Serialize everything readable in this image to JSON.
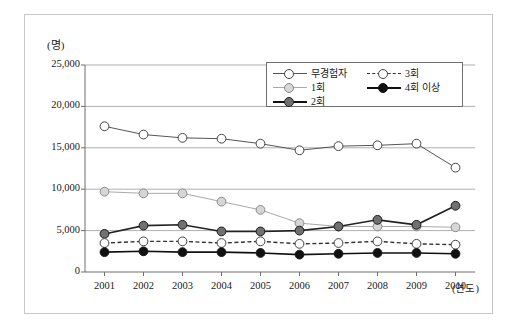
{
  "chart_data": {
    "type": "line",
    "title": "",
    "subtitle": "",
    "unit_label": "(명)",
    "xlabel": "(연도)",
    "ylabel": "",
    "categories": [
      "2001",
      "2002",
      "2003",
      "2004",
      "2005",
      "2006",
      "2007",
      "2008",
      "2009",
      "2010"
    ],
    "ylim": [
      0,
      25000
    ],
    "yticks": [
      0,
      5000,
      10000,
      15000,
      20000,
      25000
    ],
    "ytick_labels": [
      "0",
      "5,000",
      "10,000",
      "15,000",
      "20,000",
      "25,000"
    ],
    "grid": "horizontal",
    "legend_position": "inside-top-right",
    "series": [
      {
        "name": "무경험자",
        "marker": "open-circle",
        "marker_fill": "#ffffff",
        "line_color": "#555555",
        "line_style": "solid",
        "values": [
          17600,
          16600,
          16200,
          16100,
          15500,
          14700,
          15200,
          15300,
          15500,
          12600
        ]
      },
      {
        "name": "1회",
        "marker": "filled-circle",
        "marker_fill": "#d6d6d6",
        "line_color": "#a9a9a9",
        "line_style": "solid",
        "values": [
          9700,
          9500,
          9500,
          8500,
          7500,
          5900,
          5500,
          5500,
          5500,
          5400
        ]
      },
      {
        "name": "2회",
        "marker": "filled-circle",
        "marker_fill": "#707070",
        "line_color": "#222222",
        "line_style": "solid",
        "values": [
          4600,
          5600,
          5700,
          4900,
          4900,
          5000,
          5500,
          6300,
          5700,
          8000
        ]
      },
      {
        "name": "3회",
        "marker": "open-circle",
        "marker_fill": "#ffffff",
        "line_color": "#333333",
        "line_style": "dashed",
        "values": [
          3500,
          3700,
          3700,
          3500,
          3700,
          3400,
          3500,
          3700,
          3400,
          3300
        ]
      },
      {
        "name": "4회 이상",
        "marker": "filled-circle",
        "marker_fill": "#111111",
        "line_color": "#111111",
        "line_style": "solid",
        "values": [
          2400,
          2500,
          2400,
          2400,
          2300,
          2100,
          2200,
          2300,
          2300,
          2200
        ]
      }
    ]
  },
  "legend": {
    "left_column": [
      {
        "label": "무경험자"
      },
      {
        "label": "1회"
      },
      {
        "label": "2회"
      }
    ],
    "right_column": [
      {
        "label": "3회"
      },
      {
        "label": "4회 이상"
      }
    ]
  },
  "colors": {
    "frame": "#c8c8c8",
    "axis": "#6f6f6f",
    "grid": "#9a9a9a",
    "background": "#ffffff"
  }
}
